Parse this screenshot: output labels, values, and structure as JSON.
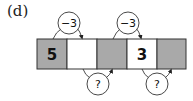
{
  "label": "(d)",
  "colors": {
    "shaded": "#a9a9a9",
    "blank": "#ffffff",
    "stroke": "#333333"
  },
  "cells": [
    {
      "value": "5",
      "shaded": true
    },
    {
      "value": "",
      "shaded": false
    },
    {
      "value": "",
      "shaded": true
    },
    {
      "value": "3",
      "shaded": false
    },
    {
      "value": "",
      "shaded": true
    }
  ],
  "top_operators": [
    {
      "text": "−3",
      "from_cell": 1,
      "to_cell": 2
    },
    {
      "text": "−3",
      "from_cell": 4,
      "to_cell": 5
    }
  ],
  "bottom_operators": [
    {
      "text": "?",
      "from_cell": 2,
      "to_cell": 3
    },
    {
      "text": "?",
      "from_cell": 4,
      "to_cell": 5
    }
  ]
}
